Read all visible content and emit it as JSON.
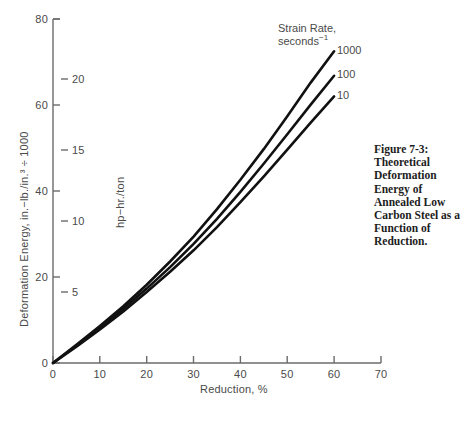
{
  "figure": {
    "caption": "Figure 7-3: Theoretical Deformation Energy of Annealed Low Carbon Steel as a Function of Reduction."
  },
  "legend": {
    "title_line1": "Strain Rate,",
    "title_line2_base": "seconds",
    "title_line2_exp": "−1"
  },
  "axes": {
    "x_title": "Reduction, %",
    "y_primary_title": "Deformation Energy, in.−lb./in.³ ÷ 1000",
    "y_secondary_title": "hp−hr./ton",
    "x_ticks": [
      "0",
      "10",
      "20",
      "30",
      "40",
      "50",
      "60",
      "70"
    ],
    "y_primary_ticks": [
      "0",
      "20",
      "40",
      "60",
      "80"
    ],
    "y_secondary_ticks": [
      "5",
      "10",
      "15",
      "20"
    ]
  },
  "series_labels": {
    "s1000": "1000",
    "s100": "100",
    "s10": "10"
  },
  "colors": {
    "curve": "#111111",
    "axis": "#6b6b6b",
    "text": "#4a4a4a",
    "caption": "#1d1d1d",
    "background": "#ffffff"
  },
  "chart_data": {
    "type": "line",
    "title": "Theoretical Deformation Energy of Annealed Low Carbon Steel as a Function of Reduction",
    "xlabel": "Reduction, %",
    "ylabel": "Deformation Energy, in.−lb./in.³ ÷ 1000",
    "ylabel_secondary": "hp−hr./ton",
    "xlim": [
      0,
      70
    ],
    "ylim": [
      0,
      80
    ],
    "ylim_secondary": [
      0,
      24.24
    ],
    "grid": false,
    "legend_position": "upper-right-inline",
    "legend_title": "Strain Rate, seconds−1",
    "x_ticks": [
      0,
      10,
      20,
      30,
      40,
      50,
      60,
      70
    ],
    "y_ticks": [
      0,
      20,
      40,
      60,
      80
    ],
    "y_secondary_ticks": [
      5,
      10,
      15,
      20
    ],
    "x": [
      0,
      5,
      10,
      15,
      20,
      25,
      30,
      35,
      40,
      45,
      50,
      55,
      60
    ],
    "series": [
      {
        "name": "1000",
        "label": "1000",
        "values": [
          0,
          4.2,
          8.6,
          13.2,
          18.2,
          23.6,
          29.4,
          35.8,
          42.6,
          49.8,
          57.4,
          65.2,
          72.5
        ]
      },
      {
        "name": "100",
        "label": "100",
        "values": [
          0,
          4.0,
          8.2,
          12.6,
          17.3,
          22.3,
          27.7,
          33.5,
          39.8,
          46.4,
          53.2,
          60.1,
          66.8
        ]
      },
      {
        "name": "10",
        "label": "10",
        "values": [
          0,
          3.8,
          7.8,
          12.0,
          16.5,
          21.2,
          26.2,
          31.6,
          37.4,
          43.4,
          49.6,
          55.9,
          62.0
        ]
      }
    ]
  }
}
